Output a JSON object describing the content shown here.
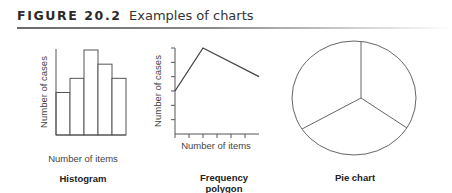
{
  "figure": {
    "label": "FIGURE 20.2",
    "caption": "Examples of charts"
  },
  "chart_data": [
    {
      "type": "bar",
      "name": "Histogram",
      "title": "Histogram",
      "xlabel": "Number of items",
      "ylabel": "Number of cases",
      "categories": [
        "1",
        "2",
        "3",
        "4",
        "5"
      ],
      "values": [
        3,
        4,
        6,
        5,
        4
      ],
      "ylim": [
        0,
        6
      ],
      "grid": false,
      "tick_labels": false
    },
    {
      "type": "line",
      "name": "Frequency polygon",
      "title": "Frequency polygon",
      "title_lines": [
        "Frequency",
        "polygon"
      ],
      "xlabel": "Number of items",
      "ylabel": "Number of cases",
      "x": [
        0,
        2,
        6
      ],
      "values": [
        3,
        6,
        4
      ],
      "xlim": [
        0,
        6
      ],
      "ylim": [
        0,
        6
      ],
      "x_ticks": 6,
      "y_ticks": 6,
      "grid": false,
      "tick_labels": false
    },
    {
      "type": "pie",
      "name": "Pie chart",
      "title": "Pie chart",
      "slices": [
        {
          "label": "",
          "value": 33.3
        },
        {
          "label": "",
          "value": 33.3
        },
        {
          "label": "",
          "value": 33.3
        }
      ]
    }
  ],
  "colors": {
    "stroke": "#555555",
    "text": "#333333"
  }
}
